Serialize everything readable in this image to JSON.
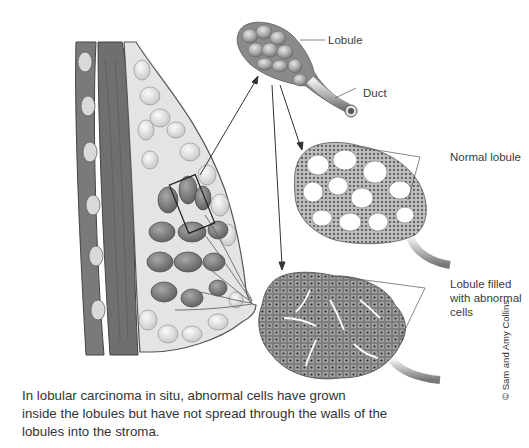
{
  "labels": {
    "lobule": "Lobule",
    "duct": "Duct",
    "normal_lobule": "Normal lobule",
    "abnormal_lobule_line1": "Lobule filled",
    "abnormal_lobule_line2": "with abnormal",
    "abnormal_lobule_line3": "cells"
  },
  "caption": {
    "line1": "In lobular carcinoma in situ, abnormal cells have grown",
    "line2": "inside the lobules but have not spread through the walls of the",
    "line3": "lobules into the stroma."
  },
  "credit": "© Sam and Amy Collins",
  "colors": {
    "background": "#ffffff",
    "tissue_dark": "#6e6e6e",
    "tissue_mid": "#9a9a9a",
    "tissue_light": "#d6d6d6",
    "outline": "#555555",
    "text": "#333333"
  }
}
